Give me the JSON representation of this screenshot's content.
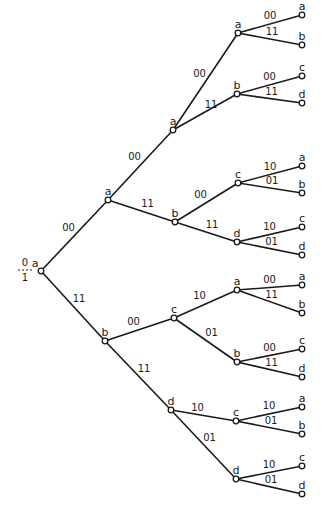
{
  "diagram": {
    "type": "trellis-tree",
    "initial_state_fraction": {
      "numerator": "0",
      "denominator": "1"
    },
    "nodes": [
      {
        "id": "n0",
        "state": "a",
        "x": 41,
        "y": 271
      },
      {
        "id": "n1",
        "state": "a",
        "x": 108,
        "y": 200
      },
      {
        "id": "n2",
        "state": "b",
        "x": 105,
        "y": 341
      },
      {
        "id": "n3",
        "state": "a",
        "x": 173,
        "y": 130
      },
      {
        "id": "n4",
        "state": "b",
        "x": 175,
        "y": 222
      },
      {
        "id": "n5",
        "state": "c",
        "x": 174,
        "y": 318
      },
      {
        "id": "n6",
        "state": "d",
        "x": 171,
        "y": 410
      },
      {
        "id": "n7",
        "state": "a",
        "x": 238,
        "y": 33
      },
      {
        "id": "n8",
        "state": "b",
        "x": 237,
        "y": 94
      },
      {
        "id": "n9",
        "state": "c",
        "x": 238,
        "y": 183
      },
      {
        "id": "n10",
        "state": "d",
        "x": 237,
        "y": 242
      },
      {
        "id": "n11",
        "state": "a",
        "x": 237,
        "y": 290
      },
      {
        "id": "n12",
        "state": "b",
        "x": 237,
        "y": 362
      },
      {
        "id": "n13",
        "state": "c",
        "x": 236,
        "y": 421
      },
      {
        "id": "n14",
        "state": "d",
        "x": 236,
        "y": 479
      },
      {
        "id": "l0",
        "state": "a",
        "x": 302,
        "y": 15
      },
      {
        "id": "l1",
        "state": "b",
        "x": 302,
        "y": 45
      },
      {
        "id": "l2",
        "state": "c",
        "x": 302,
        "y": 76
      },
      {
        "id": "l3",
        "state": "d",
        "x": 302,
        "y": 103
      },
      {
        "id": "l4",
        "state": "a",
        "x": 302,
        "y": 166
      },
      {
        "id": "l5",
        "state": "b",
        "x": 302,
        "y": 193
      },
      {
        "id": "l6",
        "state": "c",
        "x": 302,
        "y": 227
      },
      {
        "id": "l7",
        "state": "d",
        "x": 302,
        "y": 255
      },
      {
        "id": "l8",
        "state": "a",
        "x": 302,
        "y": 285
      },
      {
        "id": "l9",
        "state": "b",
        "x": 302,
        "y": 313
      },
      {
        "id": "l10",
        "state": "c",
        "x": 302,
        "y": 349
      },
      {
        "id": "l11",
        "state": "d",
        "x": 302,
        "y": 377
      },
      {
        "id": "l12",
        "state": "a",
        "x": 302,
        "y": 407
      },
      {
        "id": "l13",
        "state": "b",
        "x": 302,
        "y": 434
      },
      {
        "id": "l14",
        "state": "c",
        "x": 302,
        "y": 466
      },
      {
        "id": "l15",
        "state": "d",
        "x": 302,
        "y": 494
      }
    ],
    "edges": [
      {
        "from": "n0",
        "to": "n1",
        "label": "00"
      },
      {
        "from": "n0",
        "to": "n2",
        "label": "11"
      },
      {
        "from": "n1",
        "to": "n3",
        "label": "00"
      },
      {
        "from": "n1",
        "to": "n4",
        "label": "11"
      },
      {
        "from": "n2",
        "to": "n5",
        "label": "00"
      },
      {
        "from": "n2",
        "to": "n6",
        "label": "11"
      },
      {
        "from": "n3",
        "to": "n7",
        "label": "00"
      },
      {
        "from": "n3",
        "to": "n8",
        "label": "11"
      },
      {
        "from": "n4",
        "to": "n9",
        "label": "00"
      },
      {
        "from": "n4",
        "to": "n10",
        "label": "11"
      },
      {
        "from": "n5",
        "to": "n11",
        "label": "10"
      },
      {
        "from": "n5",
        "to": "n12",
        "label": "01"
      },
      {
        "from": "n6",
        "to": "n13",
        "label": "10"
      },
      {
        "from": "n6",
        "to": "n14",
        "label": "01"
      },
      {
        "from": "n7",
        "to": "l0",
        "label": "00"
      },
      {
        "from": "n7",
        "to": "l1",
        "label": "11"
      },
      {
        "from": "n8",
        "to": "l2",
        "label": "00"
      },
      {
        "from": "n8",
        "to": "l3",
        "label": "11"
      },
      {
        "from": "n9",
        "to": "l4",
        "label": "10"
      },
      {
        "from": "n9",
        "to": "l5",
        "label": "01"
      },
      {
        "from": "n10",
        "to": "l6",
        "label": "10"
      },
      {
        "from": "n10",
        "to": "l7",
        "label": "01"
      },
      {
        "from": "n11",
        "to": "l8",
        "label": "00"
      },
      {
        "from": "n11",
        "to": "l9",
        "label": "11"
      },
      {
        "from": "n12",
        "to": "l10",
        "label": "00"
      },
      {
        "from": "n12",
        "to": "l11",
        "label": "11"
      },
      {
        "from": "n13",
        "to": "l12",
        "label": "10"
      },
      {
        "from": "n13",
        "to": "l13",
        "label": "01"
      },
      {
        "from": "n14",
        "to": "l14",
        "label": "10"
      },
      {
        "from": "n14",
        "to": "l15",
        "label": "01"
      }
    ]
  }
}
